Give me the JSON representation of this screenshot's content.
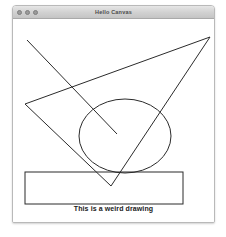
{
  "window": {
    "title": "Hello Canvas",
    "controls": [
      {
        "name": "close",
        "color": "#9a9a9a"
      },
      {
        "name": "minimize",
        "color": "#9a9a9a"
      },
      {
        "name": "zoom",
        "color": "#9a9a9a"
      }
    ]
  },
  "canvas": {
    "caption": "This is a weird drawing",
    "stroke_color": "#2b2b2b",
    "background_color": "#ffffff",
    "shapes": {
      "triangle": {
        "points": "12,85 197,18 98,167",
        "label": "triangle"
      },
      "pointer_line": {
        "x1": 14,
        "y1": 21,
        "x2": 104,
        "y2": 115,
        "label": "diagonal-line"
      },
      "ellipse": {
        "cx": 112,
        "cy": 117,
        "rx": 46,
        "ry": 37,
        "label": "ellipse"
      },
      "rectangle": {
        "x": 12,
        "y": 153,
        "width": 158,
        "height": 32,
        "label": "rectangle"
      }
    }
  }
}
